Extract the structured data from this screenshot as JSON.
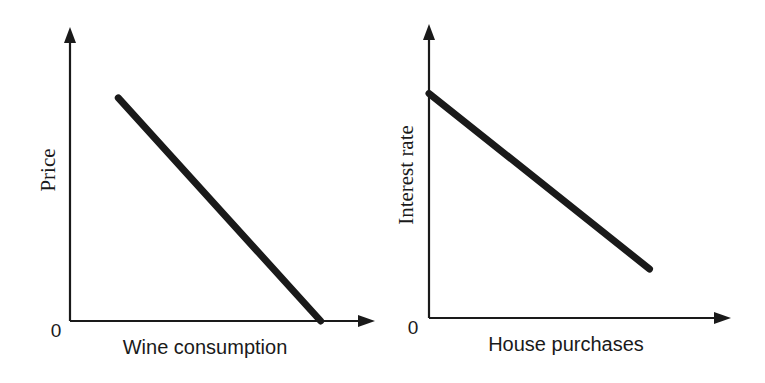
{
  "chart_data": [
    {
      "type": "line",
      "title": "",
      "xlabel": "Wine consumption",
      "ylabel": "Price",
      "origin_label": "0",
      "xlim": [
        0,
        100
      ],
      "ylim": [
        0,
        100
      ],
      "grid": false,
      "series": [
        {
          "name": "demand",
          "color": "#1a1a1a",
          "points": [
            [
              16,
              78
            ],
            [
              83,
              0
            ]
          ]
        }
      ]
    },
    {
      "type": "line",
      "title": "",
      "xlabel": "House purchases",
      "ylabel": "Interest rate",
      "origin_label": "0",
      "xlim": [
        0,
        100
      ],
      "ylim": [
        0,
        100
      ],
      "grid": false,
      "series": [
        {
          "name": "demand",
          "color": "#1a1a1a",
          "points": [
            [
              0,
              78
            ],
            [
              73,
              17
            ]
          ]
        }
      ]
    }
  ]
}
